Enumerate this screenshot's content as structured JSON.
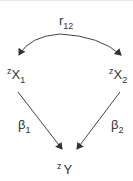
{
  "diagram": {
    "type": "path-diagram",
    "correlation": {
      "base": "r",
      "sub": "12"
    },
    "nodes": [
      {
        "id": "x1",
        "sup": "z",
        "base": "X",
        "sub": "1"
      },
      {
        "id": "x2",
        "sup": "z",
        "base": "X",
        "sub": "2"
      },
      {
        "id": "y",
        "sup": "z",
        "base": "Y",
        "sub": ""
      }
    ],
    "paths": [
      {
        "from": "x1",
        "to": "y",
        "label_base": "β",
        "label_sub": "1"
      },
      {
        "from": "x2",
        "to": "y",
        "label_base": "β",
        "label_sub": "2"
      }
    ],
    "line_color": "#444444"
  }
}
